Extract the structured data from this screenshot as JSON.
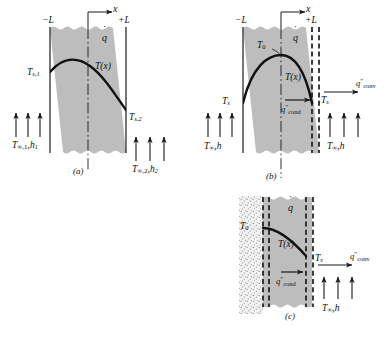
{
  "figure": {
    "panels": [
      {
        "id": "a",
        "caption": "(a)",
        "description": "Symmetric plane wall with generation, convection on both surfaces with different conditions",
        "axis": {
          "x_label": "x",
          "left_tick": "−L",
          "right_tick": "+L"
        },
        "generation_symbol": "q",
        "curve_label": "T(x)",
        "labels": {
          "surface_left": {
            "base": "T",
            "sub": "s,1"
          },
          "surface_right": {
            "base": "T",
            "sub": "s,2"
          },
          "fluid_left": {
            "text": "T∞,1, h1"
          },
          "fluid_right": {
            "text": "T∞,2, h2"
          }
        }
      },
      {
        "id": "b",
        "caption": "(b)",
        "description": "Symmetric wall, adiabatic midplane, equivalent half-wall with conduction to surface and convection out",
        "axis": {
          "x_label": "x",
          "left_tick": "−L",
          "right_tick": "+L"
        },
        "generation_symbol": "q",
        "curve_label": "T(x)",
        "labels": {
          "centerline_temp": {
            "base": "T",
            "sub": "0"
          },
          "surface_temp": {
            "base": "T",
            "sub": "s"
          },
          "flux_cond": {
            "base": "q",
            "prime": "″",
            "sub": "cond"
          },
          "flux_conv": {
            "base": "q",
            "prime": "″",
            "sub": "conv"
          },
          "fluid_left": {
            "text": "T∞, h"
          },
          "fluid_right": {
            "text": "T∞, h"
          }
        }
      },
      {
        "id": "c",
        "caption": "(c)",
        "description": "Insulated (adiabatic) left surface, generation in wall, conduction to right surface and convection out",
        "generation_symbol": "q",
        "curve_label": "T(x)",
        "labels": {
          "adiabatic_surface_temp": {
            "base": "T",
            "sub": "0"
          },
          "surface_temp": {
            "base": "T",
            "sub": "s"
          },
          "flux_cond": {
            "base": "q",
            "prime": "″",
            "sub": "cond"
          },
          "flux_conv": {
            "base": "q",
            "prime": "″",
            "sub": "conv"
          },
          "fluid_right": {
            "text": "T∞, h"
          }
        }
      }
    ],
    "colors": {
      "wall_fill": "#bdbdbd",
      "stipple_fill": "#ededed",
      "line": "#1a1a1a",
      "background": "#ffffff"
    }
  }
}
